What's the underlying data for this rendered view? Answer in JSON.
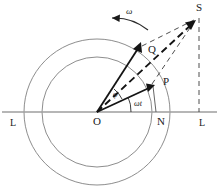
{
  "figure": {
    "colors": {
      "ink": "#1a1a1a",
      "circle": "#777777",
      "axis": "#9a9a9a",
      "dashed": "#333333"
    },
    "points": [
      {
        "name": "O",
        "label": "O",
        "x": 97,
        "y": 112,
        "role": "origin"
      },
      {
        "name": "N",
        "label": "N",
        "x": 161,
        "y": 112,
        "role": "foot-of-perpendicular"
      },
      {
        "name": "P",
        "label": "P",
        "x": 158,
        "y": 88,
        "role": "inner-phasor-tip"
      },
      {
        "name": "Q",
        "label": "Q",
        "x": 145,
        "y": 48,
        "role": "outer-phasor-tip"
      },
      {
        "name": "S",
        "label": "S",
        "x": 199,
        "y": 10,
        "role": "resultant-tip"
      }
    ],
    "axis_labels": [
      {
        "name": "left",
        "label": "L",
        "x": 12,
        "y": 122
      },
      {
        "name": "right",
        "label": "L",
        "x": 200,
        "y": 122
      }
    ],
    "angle_labels": [
      {
        "name": "phi",
        "label": "φ",
        "x": 110,
        "y": 92
      },
      {
        "name": "omega-t",
        "label": "ωt",
        "x": 136,
        "y": 102
      }
    ],
    "rotation_label": {
      "name": "omega",
      "label": "ω",
      "x": 127,
      "y": 12
    },
    "circles": [
      {
        "name": "inner-circle",
        "cx": 97,
        "cy": 112,
        "r": 55
      },
      {
        "name": "outer-circle",
        "cx": 97,
        "cy": 112,
        "r": 73
      }
    ],
    "vectors": [
      {
        "name": "vector-OQ",
        "from": "O",
        "to": "Q",
        "style": "solid-bold"
      },
      {
        "name": "vector-OP",
        "from": "O",
        "to": "P",
        "style": "solid-bold"
      },
      {
        "name": "vector-OS",
        "from": "O",
        "to": "S",
        "style": "dashed-bold"
      },
      {
        "name": "construction-QS",
        "from": "Q",
        "to": "S",
        "style": "dashed-thin"
      },
      {
        "name": "construction-PS",
        "from": "P",
        "to": "S",
        "style": "dashed-thin"
      },
      {
        "name": "projection-SL",
        "from": "S",
        "to": "axis",
        "style": "dashed-thin-vertical"
      },
      {
        "name": "projection-PN",
        "from": "P",
        "to": "N",
        "style": "solid-thin-vertical"
      }
    ],
    "horizontal_axis": {
      "name": "axis-LL",
      "y": 112,
      "x1": 2,
      "x2": 217
    }
  }
}
